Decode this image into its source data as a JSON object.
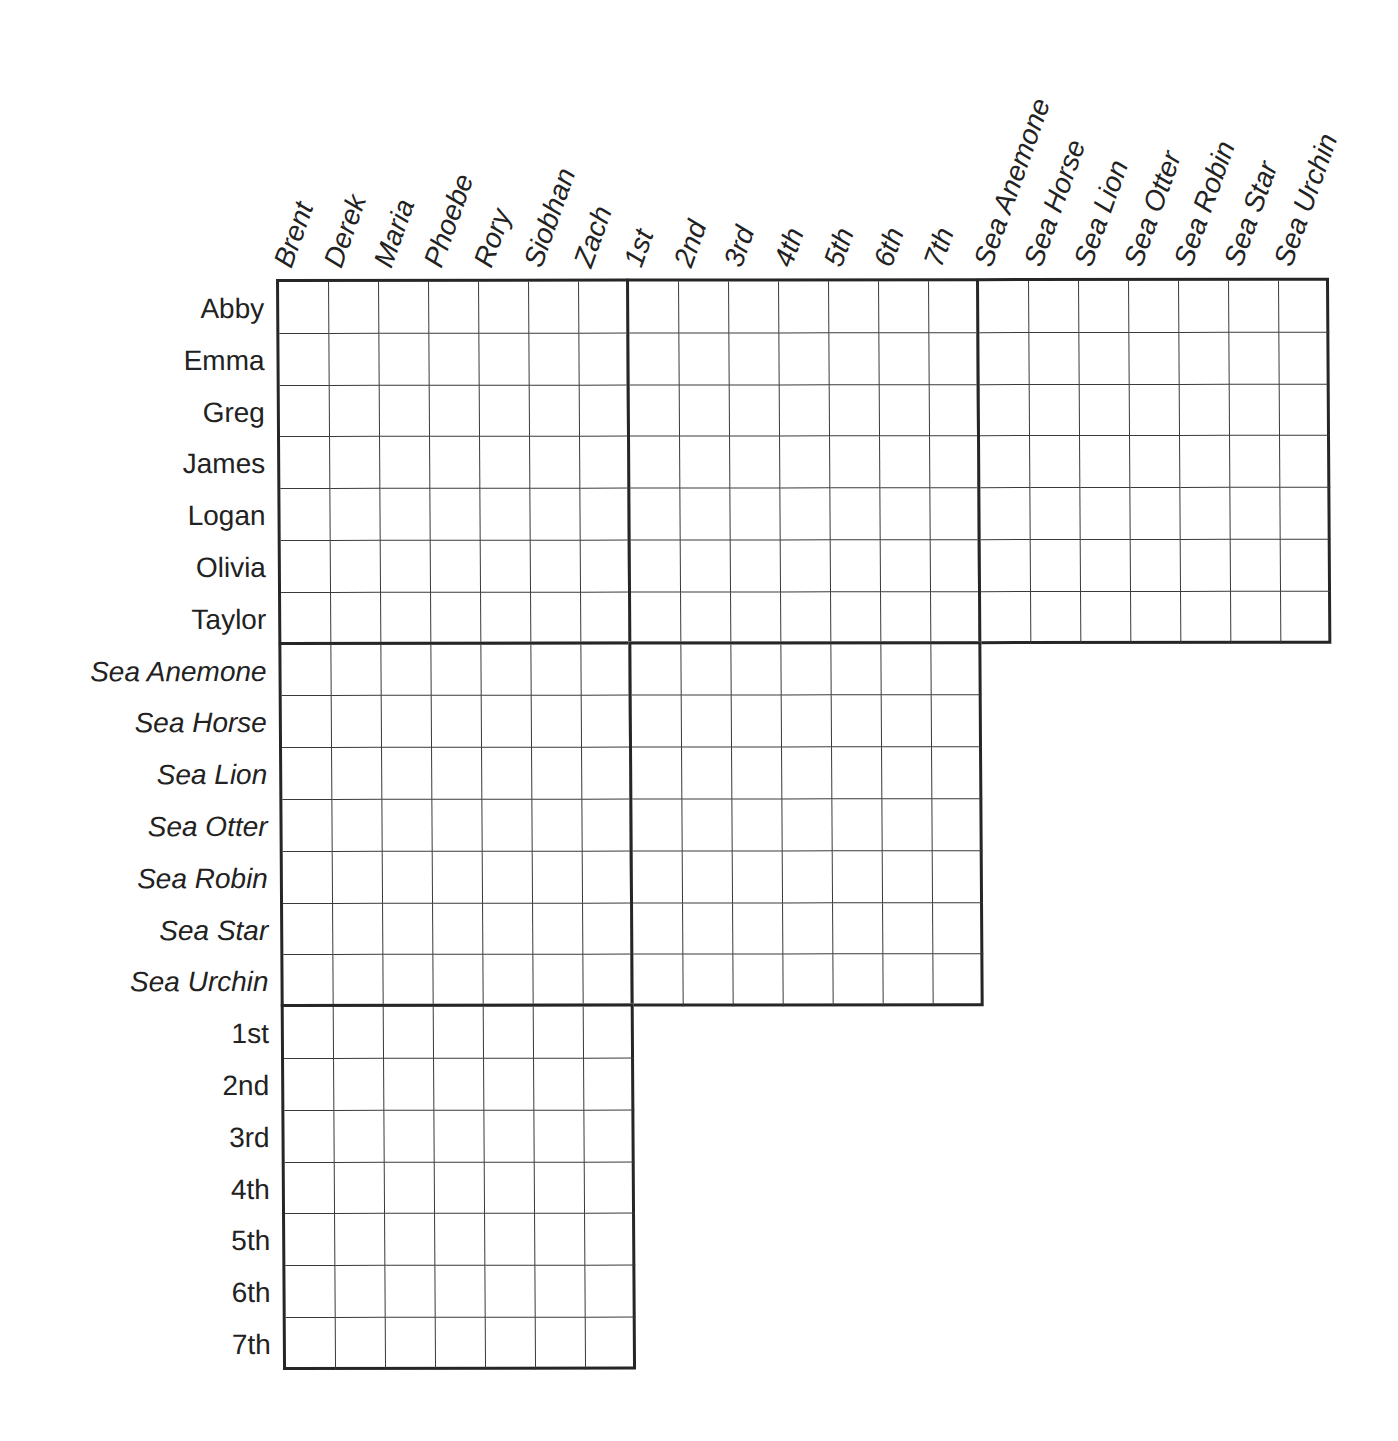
{
  "puzzle": {
    "type": "logic-grid",
    "cell_width": 50,
    "cell_height": 51.8,
    "column_groups": [
      {
        "name": "people",
        "style": "italic",
        "labels": [
          "Brent",
          "Derek",
          "Maria",
          "Phoebe",
          "Rory",
          "Siobhan",
          "Zach"
        ]
      },
      {
        "name": "places",
        "style": "italic",
        "labels": [
          "1st",
          "2nd",
          "3rd",
          "4th",
          "5th",
          "6th",
          "7th"
        ]
      },
      {
        "name": "animals",
        "style": "italic",
        "labels": [
          "Sea Anemone",
          "Sea Horse",
          "Sea Lion",
          "Sea Otter",
          "Sea Robin",
          "Sea Star",
          "Sea Urchin"
        ]
      }
    ],
    "row_groups": [
      {
        "name": "people",
        "style": "normal",
        "labels": [
          "Abby",
          "Emma",
          "Greg",
          "James",
          "Logan",
          "Olivia",
          "Taylor"
        ]
      },
      {
        "name": "animals",
        "style": "italic",
        "labels": [
          "Sea Anemone",
          "Sea Horse",
          "Sea Lion",
          "Sea Otter",
          "Sea Robin",
          "Sea Star",
          "Sea Urchin"
        ]
      },
      {
        "name": "places",
        "style": "normal",
        "labels": [
          "1st",
          "2nd",
          "3rd",
          "4th",
          "5th",
          "6th",
          "7th"
        ]
      }
    ],
    "blocks": [
      {
        "row_group": 0,
        "col_group": 0
      },
      {
        "row_group": 0,
        "col_group": 1
      },
      {
        "row_group": 0,
        "col_group": 2
      },
      {
        "row_group": 1,
        "col_group": 0
      },
      {
        "row_group": 1,
        "col_group": 1
      },
      {
        "row_group": 2,
        "col_group": 0
      }
    ],
    "cells_marked": []
  },
  "colors": {
    "background": "#ffffff",
    "text": "#222222",
    "grid_line": "#3a3a3a",
    "block_border": "#262626"
  }
}
